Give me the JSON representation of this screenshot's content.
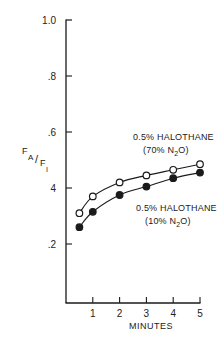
{
  "chart_data": {
    "type": "line",
    "title": "",
    "xlabel": "MINUTES",
    "ylabel": "FA/FI",
    "ylabel_parts": {
      "main1": "F",
      "sub1": "A",
      "slash": "/",
      "main2": "F",
      "sub2": "I"
    },
    "xlim": [
      0,
      5
    ],
    "ylim": [
      0,
      1.0
    ],
    "x_ticks": [
      1,
      2,
      3,
      4,
      5
    ],
    "x_tick_labels": [
      "1",
      "2",
      "3",
      "4",
      "5"
    ],
    "y_ticks": [
      0.2,
      0.4,
      0.6,
      0.8,
      1.0
    ],
    "y_tick_labels": [
      ".2",
      "4",
      ".6",
      ".8",
      "1.0"
    ],
    "grid": false,
    "legend": "inline annotations",
    "x": [
      0.5,
      1,
      2,
      3,
      4,
      5
    ],
    "series": [
      {
        "name": "0.5% HALOTHANE (70% N2O)",
        "marker": "open-circle",
        "values": [
          0.31,
          0.37,
          0.42,
          0.445,
          0.465,
          0.485
        ],
        "label_line1": "0.5% HALOTHANE",
        "label_line2_pre": "(70% N",
        "label_line2_sub": "2",
        "label_line2_post": "O)"
      },
      {
        "name": "0.5% HALOTHANE (10% N2O)",
        "marker": "filled-circle",
        "values": [
          0.26,
          0.315,
          0.375,
          0.405,
          0.435,
          0.455
        ],
        "label_line1": "0.5% HALOTHANE",
        "label_line2_pre": "(10% N",
        "label_line2_sub": "2",
        "label_line2_post": "O)"
      }
    ]
  },
  "colors": {
    "ink": "#1a1a1a",
    "background": "#ffffff"
  }
}
